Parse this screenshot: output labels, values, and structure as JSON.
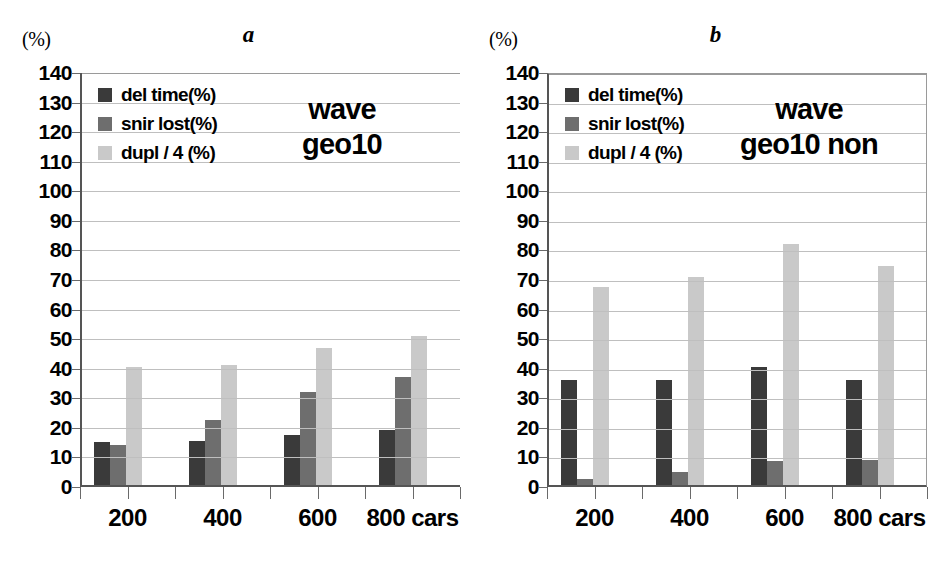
{
  "figure": {
    "background": "#ffffff",
    "panels": [
      {
        "letter": "a",
        "unit_label": "(%)",
        "annotation_line1": "wave",
        "annotation_line2": "geo10"
      },
      {
        "letter": "b",
        "unit_label": "(%)",
        "annotation_line1": "wave",
        "annotation_line2": "geo10 non"
      }
    ]
  },
  "legend": {
    "entries": [
      {
        "label": "del time(%)",
        "color": "#3a3a3a"
      },
      {
        "label": "snir lost(%)",
        "color": "#6e6e6e"
      },
      {
        "label": "dupl / 4 (%)",
        "color": "#c9c9c9"
      }
    ]
  },
  "axis": {
    "ylabels": [
      "140",
      "130",
      "120",
      "110",
      "100",
      "90",
      "80",
      "70",
      "60",
      "50",
      "40",
      "30",
      "20",
      "10",
      "0"
    ],
    "xlabels": [
      "200",
      "400",
      "600",
      "800 cars"
    ]
  },
  "chart_data": [
    {
      "type": "bar",
      "title": "a",
      "annotation": "wave geo10",
      "categories": [
        "200",
        "400",
        "600",
        "800 cars"
      ],
      "series": [
        {
          "name": "del time(%)",
          "color": "#3a3a3a",
          "values": [
            14.5,
            15.0,
            17.0,
            18.5
          ]
        },
        {
          "name": "snir lost(%)",
          "color": "#6e6e6e",
          "values": [
            13.5,
            22.0,
            31.5,
            36.5
          ]
        },
        {
          "name": "dupl / 4 (%)",
          "color": "#c9c9c9",
          "values": [
            40.0,
            40.5,
            46.5,
            50.5
          ]
        }
      ],
      "xlabel": "cars",
      "ylabel": "(%)",
      "ylim": [
        0,
        140
      ],
      "ytick_step": 10,
      "grid": true,
      "legend_position": "top-left"
    },
    {
      "type": "bar",
      "title": "b",
      "annotation": "wave geo10 non",
      "categories": [
        "200",
        "400",
        "600",
        "800 cars"
      ],
      "series": [
        {
          "name": "del time(%)",
          "color": "#3a3a3a",
          "values": [
            35.5,
            35.5,
            40.0,
            35.5
          ]
        },
        {
          "name": "snir lost(%)",
          "color": "#6e6e6e",
          "values": [
            2.0,
            4.5,
            8.0,
            8.5
          ]
        },
        {
          "name": "dupl / 4 (%)",
          "color": "#c9c9c9",
          "values": [
            67.0,
            70.5,
            81.5,
            74.0
          ]
        }
      ],
      "xlabel": "cars",
      "ylabel": "(%)",
      "ylim": [
        0,
        140
      ],
      "ytick_step": 10,
      "grid": true,
      "legend_position": "top-left"
    }
  ]
}
